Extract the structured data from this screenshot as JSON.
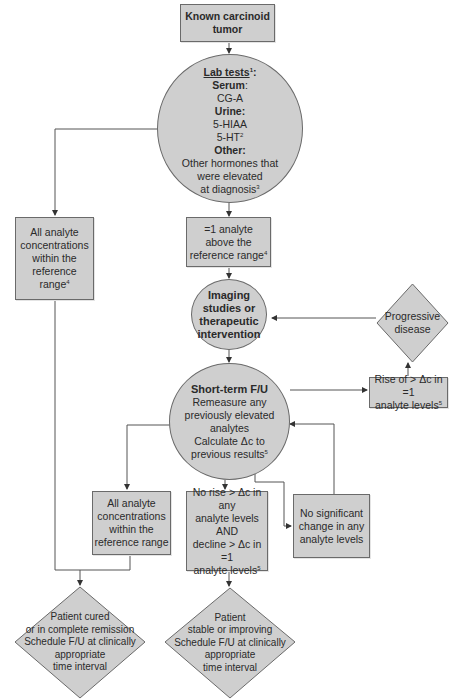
{
  "colors": {
    "fill": "#cfcfcf",
    "stroke": "#6a6a6a",
    "line": "#555555",
    "text": "#2a2a2a"
  },
  "nodes": {
    "start": {
      "lines": [
        "Known carcinoid",
        "tumor"
      ]
    },
    "lab_tests": {
      "title": "Lab tests",
      "title_sup": "1",
      "title_suffix": ":",
      "serum_label": "Serum",
      "serum_suffix": ":",
      "serum_value": "CG-A",
      "urine_label": "Urine:",
      "urine_values": [
        "5-HIAA",
        "5-HT"
      ],
      "urine_sup": "2",
      "other_label": "Other:",
      "other_lines": [
        "Other hormones that",
        "were elevated",
        "at diagnosis"
      ],
      "other_sup": "3"
    },
    "all_within_top": {
      "lines": [
        "All analyte",
        "concentrations",
        "within the",
        "reference range"
      ],
      "sup": "4"
    },
    "one_above": {
      "lines": [
        "=1 analyte",
        "above the",
        "reference range"
      ],
      "sup": "4"
    },
    "imaging": {
      "lines": [
        "Imaging",
        "studies or",
        "therapeutic",
        "intervention"
      ]
    },
    "progressive": {
      "lines": [
        "Progressive",
        "disease"
      ]
    },
    "rise": {
      "lines": [
        "Rise of > Δc in =1",
        "analyte levels"
      ],
      "sup": "5"
    },
    "short_term": {
      "title": "Short-term F/U",
      "lines": [
        "Remeasure any",
        "previously elevated",
        "analytes",
        "Calculate Δc to",
        "previous results"
      ],
      "sup": "5"
    },
    "all_within_bottom": {
      "lines": [
        "All analyte",
        "concentrations",
        "within the",
        "reference range"
      ]
    },
    "no_rise": {
      "lines": [
        "No rise > Δc in any",
        "analyte levels",
        "AND",
        "decline > Δc in =1",
        "analyte levels"
      ],
      "sup": "5"
    },
    "no_change": {
      "lines": [
        "No significant",
        "change in any",
        "analyte levels"
      ]
    },
    "cured": {
      "lines": [
        "Patient cured",
        "or in complete remission",
        "Schedule F/U at clinically",
        "appropriate",
        "time interval"
      ]
    },
    "stable": {
      "lines": [
        "Patient",
        "stable or improving",
        "Schedule F/U at clinically",
        "appropriate",
        "time interval"
      ]
    }
  }
}
